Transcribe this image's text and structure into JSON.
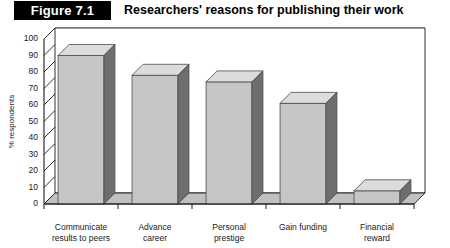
{
  "figure": {
    "tag": "Figure 7.1",
    "title": "Researchers' reasons for publishing their work"
  },
  "chart_data": {
    "type": "bar",
    "title": "Researchers' reasons for publishing their work",
    "xlabel": "",
    "ylabel": "% respondents",
    "ylim": [
      0,
      100
    ],
    "ytick_step": 10,
    "yticks": [
      0,
      10,
      20,
      30,
      40,
      50,
      60,
      70,
      80,
      90,
      100
    ],
    "ytick_labels": [
      "0",
      "10",
      "20",
      "30",
      "40",
      "50",
      "60",
      "70",
      "80",
      "90",
      "100"
    ],
    "categories": [
      "Communicate results to peers",
      "Advance career",
      "Personal prestige",
      "Gain funding",
      "Financial reward"
    ],
    "category_lines": [
      [
        "Communicate",
        "results to peers"
      ],
      [
        "Advance",
        "career"
      ],
      [
        "Personal",
        "prestige"
      ],
      [
        "Gain funding",
        ""
      ],
      [
        "Financial",
        "reward"
      ]
    ],
    "values": [
      90,
      78,
      74,
      61,
      8
    ],
    "grid": true,
    "grid_axis": "y",
    "legend": false,
    "style": "3d-column",
    "colors": {
      "bar_front": "#c6c6c6",
      "bar_side": "#6e6e6e",
      "bar_top": "#dcdcdc",
      "bar_edge": "#4a4a4a",
      "grid": "#8c8c8c",
      "axis": "#1a1a1a",
      "floor": "#c0c0c0",
      "tag_bg": "#000000",
      "tag_text": "#ffffff"
    }
  }
}
